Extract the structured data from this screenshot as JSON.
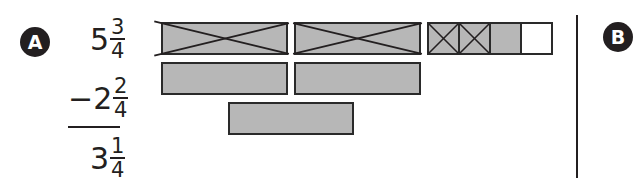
{
  "labels": {
    "part_a": "A",
    "part_b": "B"
  },
  "problem": {
    "minuend": {
      "whole": "5",
      "numerator": "3",
      "denominator": "4"
    },
    "operator": "−",
    "subtrahend": {
      "whole": "2",
      "numerator": "2",
      "denominator": "4"
    },
    "result": {
      "whole": "3",
      "numerator": "1",
      "denominator": "4"
    }
  },
  "model": {
    "row1": {
      "description": "5 3/4 modeled: two crossed-out wholes, two crossed-out quarters, one remaining shaded quarter, one empty quarter",
      "wholes": [
        {
          "crossed": true
        },
        {
          "crossed": true
        }
      ],
      "quarters": [
        {
          "crossed": true,
          "shaded": true
        },
        {
          "crossed": true,
          "shaded": true
        },
        {
          "crossed": false,
          "shaded": true
        },
        {
          "crossed": false,
          "shaded": false
        }
      ]
    },
    "row2": {
      "wholes": 2
    },
    "row3": {
      "wholes": 1
    }
  },
  "colors": {
    "ink": "#231f20",
    "shade": "#b7b7b7",
    "background": "#ffffff"
  }
}
